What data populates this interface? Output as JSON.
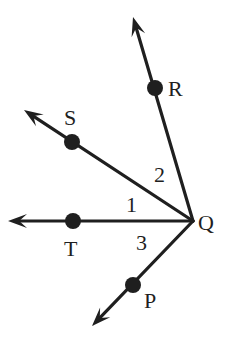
{
  "diagram": {
    "type": "angles-at-vertex",
    "vertex": {
      "name": "Q",
      "label": "Q",
      "x": 193,
      "y": 221,
      "label_x": 198,
      "label_y": 230
    },
    "colors": {
      "stroke": "#1f1f1f",
      "background": "#ffffff"
    },
    "rays": [
      {
        "id": "QR",
        "point": "R",
        "label": "R",
        "tip_x": 133,
        "tip_y": 17,
        "dot_x": 155,
        "dot_y": 88,
        "label_x": 168,
        "label_y": 96
      },
      {
        "id": "QS",
        "point": "S",
        "label": "S",
        "tip_x": 24,
        "tip_y": 110,
        "dot_x": 72,
        "dot_y": 142,
        "label_x": 64,
        "label_y": 125
      },
      {
        "id": "QT",
        "point": "T",
        "label": "T",
        "tip_x": 8,
        "tip_y": 221,
        "dot_x": 73,
        "dot_y": 221,
        "label_x": 64,
        "label_y": 256
      },
      {
        "id": "QP",
        "point": "P",
        "label": "P",
        "tip_x": 92,
        "tip_y": 326,
        "dot_x": 133,
        "dot_y": 285,
        "label_x": 144,
        "label_y": 308
      }
    ],
    "angles": [
      {
        "label": "1",
        "between": "QS-QT",
        "x": 126,
        "y": 212
      },
      {
        "label": "2",
        "between": "QR-QS",
        "x": 154,
        "y": 182
      },
      {
        "label": "3",
        "between": "QT-QP",
        "x": 136,
        "y": 250
      }
    ]
  }
}
